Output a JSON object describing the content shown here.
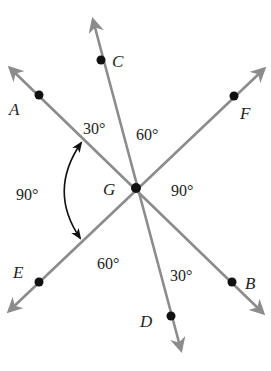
{
  "diagram": {
    "center": {
      "label": "G",
      "x": 136,
      "y": 188
    },
    "lines": [
      {
        "name": "AB",
        "from": {
          "x": 5,
          "y": 63
        },
        "to": {
          "x": 268,
          "y": 318
        }
      },
      {
        "name": "CD",
        "from": {
          "x": 91,
          "y": 13
        },
        "to": {
          "x": 183,
          "y": 357
        }
      },
      {
        "name": "EF",
        "from": {
          "x": 4,
          "y": 316
        },
        "to": {
          "x": 269,
          "y": 64
        }
      }
    ],
    "points": [
      {
        "label": "A",
        "x": 39,
        "y": 95
      },
      {
        "label": "B",
        "x": 232,
        "y": 282
      },
      {
        "label": "C",
        "x": 101,
        "y": 60
      },
      {
        "label": "D",
        "x": 171,
        "y": 316
      },
      {
        "label": "E",
        "x": 39,
        "y": 282
      },
      {
        "label": "F",
        "x": 234,
        "y": 96
      },
      {
        "label": "G",
        "x": 136,
        "y": 188
      }
    ],
    "point_labels": {
      "A": "A",
      "B": "B",
      "C": "C",
      "D": "D",
      "E": "E",
      "F": "F",
      "G": "G"
    },
    "angles": {
      "AGC": "30°",
      "CGF": "60°",
      "FGB": "90°",
      "BGD": "30°",
      "DGE": "60°",
      "EGA": "90°"
    },
    "colors": {
      "line": "#8c8c8c",
      "point": "#111111",
      "text": "#222222"
    }
  }
}
